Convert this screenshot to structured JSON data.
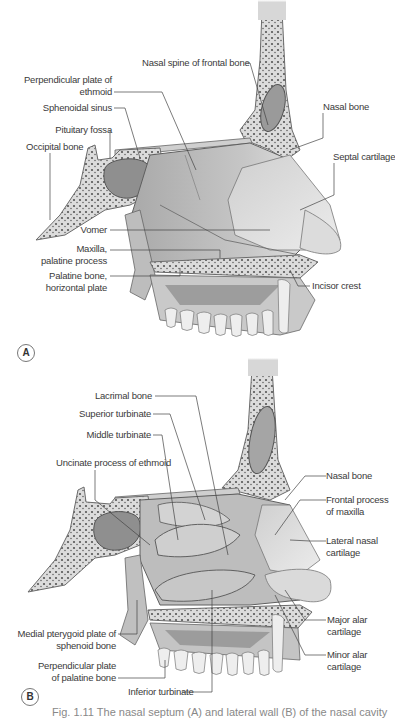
{
  "figure": {
    "panel_a": {
      "tag": "A",
      "labels": {
        "nasal_spine": "Nasal spine of frontal bone",
        "perp_plate_1": "Perpendicular plate of",
        "perp_plate_2": "ethmoid",
        "sphenoidal_sinus": "Sphenoidal sinus",
        "pituitary_fossa": "Pituitary fossa",
        "occipital_bone": "Occipital bone",
        "nasal_bone": "Nasal bone",
        "septal_cartilage": "Septal cartilage",
        "vomer": "Vomer",
        "maxilla_1": "Maxilla,",
        "maxilla_2": "palatine process",
        "palatine_1": "Palatine bone,",
        "palatine_2": "horizontal plate",
        "incisor_crest": "Incisor crest"
      }
    },
    "panel_b": {
      "tag": "B",
      "labels": {
        "lacrimal_bone": "Lacrimal bone",
        "superior_turbinate": "Superior turbinate",
        "middle_turbinate": "Middle turbinate",
        "uncinate": "Uncinate process of ethmoid",
        "nasal_bone": "Nasal bone",
        "frontal_process_1": "Frontal process",
        "frontal_process_2": "of maxilla",
        "lateral_nasal_1": "Lateral nasal",
        "lateral_nasal_2": "cartilage",
        "major_alar_1": "Major alar",
        "major_alar_2": "cartilage",
        "minor_alar_1": "Minor alar",
        "minor_alar_2": "cartilage",
        "medial_pterygoid_1": "Medial pterygoid plate of",
        "medial_pterygoid_2": "sphenoid bone",
        "perp_palatine_1": "Perpendicular plate",
        "perp_palatine_2": "of palatine bone",
        "inferior_turbinate": "Inferior turbinate"
      }
    },
    "caption": "Fig. 1.11 The nasal septum (A) and lateral wall (B) of the nasal cavity",
    "colors": {
      "bone": "#d9d9d9",
      "bone_outline": "#6b6b6b",
      "cartilage": "#e2e2e2",
      "sinus": "#a8a8a8",
      "leader": "#444444"
    }
  }
}
